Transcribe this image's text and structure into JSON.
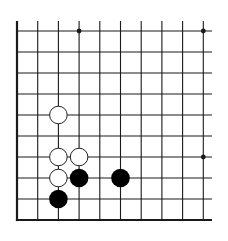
{
  "board": {
    "type": "go-board-fragment",
    "corner": "bottom-left",
    "columns": 10,
    "rows": 10,
    "origin_x": 17,
    "origin_y": 31,
    "spacing_x": 20.7,
    "spacing_y": 21,
    "line_extend_right": 212,
    "line_extend_top": 21,
    "line_color": "#1a1a1a",
    "edge_width": 2.2,
    "line_width": 1.1,
    "star_points": [
      {
        "col": 3,
        "row": 0
      },
      {
        "col": 9,
        "row": 0
      },
      {
        "col": 9,
        "row": 6
      }
    ],
    "stones": [
      {
        "color": "white",
        "col": 2,
        "row": 4
      },
      {
        "color": "white",
        "col": 2,
        "row": 6
      },
      {
        "color": "white",
        "col": 3,
        "row": 6
      },
      {
        "color": "white",
        "col": 2,
        "row": 7
      },
      {
        "color": "black",
        "col": 3,
        "row": 7
      },
      {
        "color": "black",
        "col": 5,
        "row": 7
      },
      {
        "color": "black",
        "col": 2,
        "row": 8
      }
    ],
    "stone_radius": 9.3,
    "colors": {
      "black_stone": "#000000",
      "white_stone": "#ffffff",
      "white_stone_border": "#222222"
    }
  }
}
